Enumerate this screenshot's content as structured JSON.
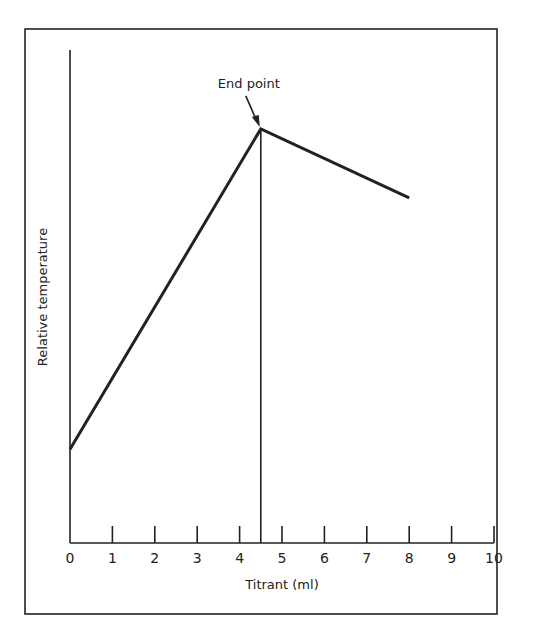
{
  "chart_data": {
    "type": "line",
    "title": "",
    "xlabel": "Titrant (ml)",
    "ylabel": "Relative temperature",
    "xlim": [
      0,
      10
    ],
    "ylim": [
      0,
      1
    ],
    "x_ticks": [
      0,
      1,
      2,
      3,
      4,
      5,
      6,
      7,
      8,
      9,
      10
    ],
    "x_tick_labels": [
      "0",
      "1",
      "2",
      "3",
      "4",
      "5",
      "6",
      "7",
      "8",
      "9",
      "10"
    ],
    "y_ticks": [],
    "grid": false,
    "series": [
      {
        "name": "Thermometric titration curve",
        "x": [
          0,
          4.5,
          8
        ],
        "y": [
          0.19,
          0.84,
          0.7
        ]
      }
    ],
    "annotations": [
      {
        "text": "End point",
        "x": 4.5,
        "y": 0.84,
        "arrow": true,
        "vertical_line_to_axis": true
      }
    ]
  },
  "colors": {
    "ink": "#222222",
    "background": "#ffffff"
  }
}
